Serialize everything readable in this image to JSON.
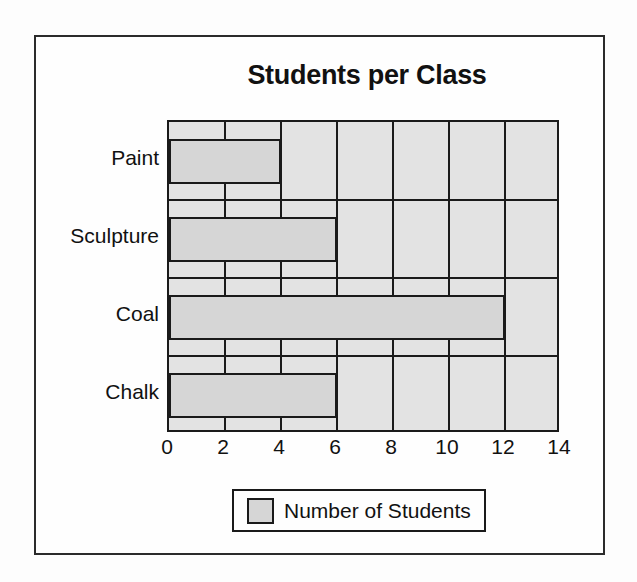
{
  "chart_data": {
    "type": "bar",
    "orientation": "horizontal",
    "title": "Students per Class",
    "xlabel": "",
    "ylabel": "",
    "categories": [
      "Paint",
      "Sculpture",
      "Coal",
      "Chalk"
    ],
    "values": [
      4,
      6,
      12,
      6
    ],
    "series": [
      {
        "name": "Number of Students",
        "values": [
          4,
          6,
          12,
          6
        ]
      }
    ],
    "xlim": [
      0,
      14
    ],
    "xticks": [
      0,
      2,
      4,
      6,
      8,
      10,
      12,
      14
    ],
    "xtick_labels": [
      "0",
      "2",
      "4",
      "6",
      "8",
      "10",
      "12",
      "14"
    ],
    "grid": "vertical",
    "legend": {
      "position": "bottom",
      "entries": [
        {
          "label": "Number of Students",
          "color": "#d6d6d6"
        }
      ]
    },
    "colors": {
      "bar_fill": "#d6d6d6",
      "bar_stroke": "#1a1a1a",
      "plot_background": "#e3e3e3",
      "frame": "#2b2b2b",
      "text": "#111111"
    }
  }
}
